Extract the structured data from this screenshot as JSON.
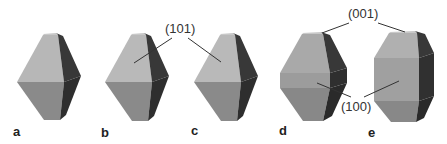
{
  "figure": {
    "panels": [
      {
        "id": "a",
        "label": "a"
      },
      {
        "id": "b",
        "label": "b"
      },
      {
        "id": "c",
        "label": "c"
      },
      {
        "id": "d",
        "label": "d"
      },
      {
        "id": "e",
        "label": "e"
      }
    ],
    "annotations": {
      "face_101": "(101)",
      "face_001": "(001)",
      "face_100": "(100)"
    },
    "colors": {
      "top_light": "#b9b9b9",
      "front_upper": "#a8a8a8",
      "front_band": "#9a9a9a",
      "front_lower": "#858585",
      "side_dark": "#333333",
      "top_cap": "#c8c8c8"
    }
  }
}
